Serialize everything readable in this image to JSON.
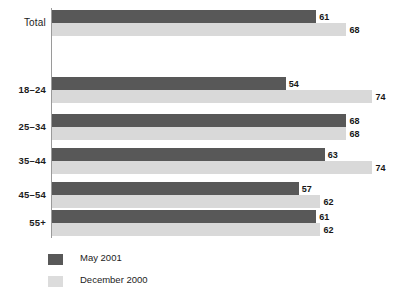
{
  "chart_data": {
    "type": "bar",
    "orientation": "horizontal",
    "title": "",
    "subtitle": "",
    "xlabel": "",
    "ylabel": "",
    "grid": false,
    "xlim": [
      0,
      74
    ],
    "legend_position": "bottom-left",
    "categories": [
      "Total",
      "18–24",
      "25–34",
      "35–44",
      "45–54",
      "55+"
    ],
    "series": [
      {
        "name": "May 2001",
        "color": "#585858",
        "values": [
          61,
          54,
          68,
          63,
          57,
          61
        ]
      },
      {
        "name": "December 2000",
        "color": "#d9d9d9",
        "values": [
          68,
          74,
          68,
          74,
          62,
          62
        ]
      }
    ]
  },
  "groups": [
    {
      "label": "Total",
      "bars": [
        {
          "series": "May 2001",
          "value": 61,
          "value_label": "61"
        },
        {
          "series": "December 2000",
          "value": 68,
          "value_label": "68"
        }
      ]
    },
    {
      "label": "18–24",
      "bars": [
        {
          "series": "May 2001",
          "value": 54,
          "value_label": "54"
        },
        {
          "series": "December 2000",
          "value": 74,
          "value_label": "74"
        }
      ]
    },
    {
      "label": "25–34",
      "bars": [
        {
          "series": "May 2001",
          "value": 68,
          "value_label": "68"
        },
        {
          "series": "December 2000",
          "value": 68,
          "value_label": "68"
        }
      ]
    },
    {
      "label": "35–44",
      "bars": [
        {
          "series": "May 2001",
          "value": 63,
          "value_label": "63"
        },
        {
          "series": "December 2000",
          "value": 74,
          "value_label": "74"
        }
      ]
    },
    {
      "label": "45–54",
      "bars": [
        {
          "series": "May 2001",
          "value": 57,
          "value_label": "57"
        },
        {
          "series": "December 2000",
          "value": 62,
          "value_label": "62"
        }
      ]
    },
    {
      "label": "55+",
      "bars": [
        {
          "series": "May 2001",
          "value": 61,
          "value_label": "61"
        },
        {
          "series": "December 2000",
          "value": 62,
          "value_label": "62"
        }
      ]
    }
  ],
  "legend": {
    "items": [
      {
        "label": "May 2001",
        "color": "#585858"
      },
      {
        "label": "December 2000",
        "color": "#dcdcdc"
      }
    ]
  },
  "layout": {
    "plot_left": 52,
    "px_per_unit": 4.33,
    "bar_height": 13,
    "group_tops": [
      10,
      77,
      114,
      148,
      182,
      210
    ],
    "axis_top": 8,
    "axis_height": 230
  }
}
